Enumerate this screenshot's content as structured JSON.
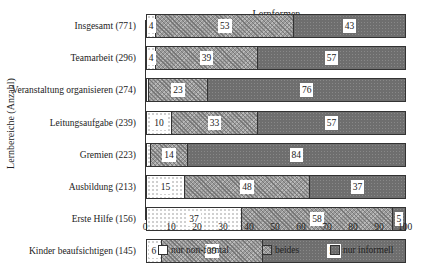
{
  "chart_data": {
    "type": "bar",
    "orientation": "horizontal-stacked-100",
    "title": "Lernformen",
    "xlabel": "",
    "ylabel": "Lernbereiche (Anzahl)",
    "xlim": [
      0,
      100
    ],
    "xticks": [
      "0",
      "10",
      "20",
      "30",
      "40",
      "50",
      "60",
      "70",
      "80",
      "90",
      "100"
    ],
    "categories": [
      "Insgesamt (771)",
      "Teamarbeit (296)",
      "Veranstaltung organisieren (274)",
      "Leitungsaufgabe (239)",
      "Gremien (223)",
      "Ausbildung (213)",
      "Erste Hilfe (156)",
      "Kinder beaufsichtigen (145)",
      "Rede vor mehr als 30 Personen (132)"
    ],
    "series": [
      {
        "name": "nur non-formal",
        "values": [
          4,
          4,
          1,
          10,
          2,
          15,
          37,
          6,
          5
        ],
        "labels": [
          "4",
          "4",
          "",
          "10",
          "",
          "15",
          "37",
          "6",
          "5"
        ]
      },
      {
        "name": "beides",
        "values": [
          53,
          39,
          23,
          33,
          14,
          48,
          58,
          39,
          22
        ],
        "labels": [
          "53",
          "39",
          "23",
          "33",
          "14",
          "48",
          "58",
          "39",
          "22"
        ]
      },
      {
        "name": "nur informell",
        "values": [
          43,
          57,
          76,
          57,
          84,
          37,
          5,
          55,
          73
        ],
        "labels": [
          "43",
          "57",
          "76",
          "57",
          "84",
          "37",
          "5",
          "55",
          "73"
        ]
      }
    ],
    "legend": [
      "nur non-formal",
      "beides",
      "nur informell"
    ],
    "legend_position": "bottom",
    "grid": false
  }
}
